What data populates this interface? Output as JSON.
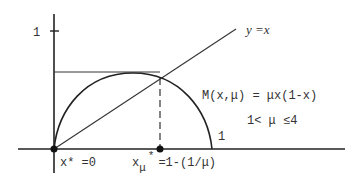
{
  "diagram": {
    "y_tick_label": "1",
    "diagonal_label": "y =x",
    "map_formula": "M(x,μ)  =  μx(1-x)",
    "param_range": "1<  μ ≤4",
    "curve_end_label": "1",
    "fixed_point_zero_label": "x* =0",
    "fixed_point_mu_label_base": "x",
    "fixed_point_mu_label_sub": "μ",
    "fixed_point_mu_label_sup": "*",
    "fixed_point_mu_label_rest": "=1-(1/μ)"
  }
}
